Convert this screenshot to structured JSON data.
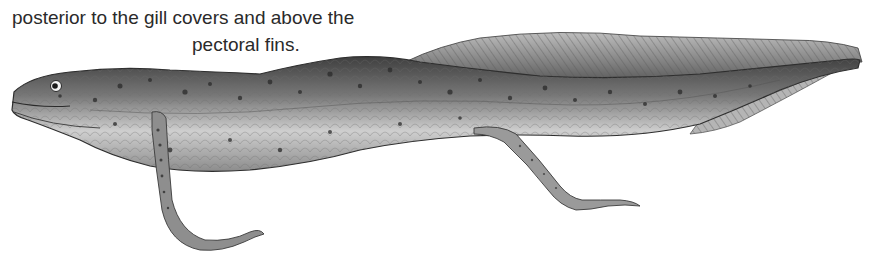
{
  "caption": {
    "line1": "posterior to the gill covers and above the",
    "line2": "pectoral fins."
  },
  "illustration": {
    "subject": "eel-like-fish-illustration",
    "style": "grayscale engraving",
    "colors": {
      "body_dark": "#4a4a4a",
      "body_mid": "#8a8a8a",
      "body_light": "#d6d6d6",
      "fin": "#9a9a9a",
      "outline": "#2e2e2e",
      "background": "#ffffff"
    }
  }
}
